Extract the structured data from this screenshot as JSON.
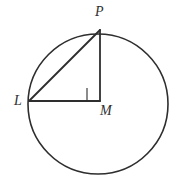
{
  "figure": {
    "kind": "geometry-diagram",
    "background_color": "#ffffff",
    "stroke_color": "#2e2e2e",
    "circle": {
      "name": "circle",
      "center_x": 98,
      "center_y": 104,
      "radius": 70,
      "stroke_width": 1.6
    },
    "points": [
      {
        "id": "P",
        "label": "P",
        "x": 100,
        "y": 30
      },
      {
        "id": "L",
        "label": "L",
        "x": 29,
        "y": 101
      },
      {
        "id": "M",
        "label": "M",
        "x": 100,
        "y": 101
      }
    ],
    "segments": [
      {
        "name": "segment-PL",
        "from": "P",
        "to": "L",
        "stroke_width": 1.8
      },
      {
        "name": "segment-PM",
        "from": "P",
        "to": "M",
        "stroke_width": 1.8
      },
      {
        "name": "segment-LM",
        "from": "L",
        "to": "M",
        "stroke_width": 1.8
      }
    ],
    "right_angle_marker": {
      "name": "right-angle-marker",
      "at_point": "M",
      "x": 87,
      "y": 87,
      "size": 13,
      "stroke_width": 1.1
    },
    "labels": {
      "P": "P",
      "L": "L",
      "M": "M"
    }
  }
}
